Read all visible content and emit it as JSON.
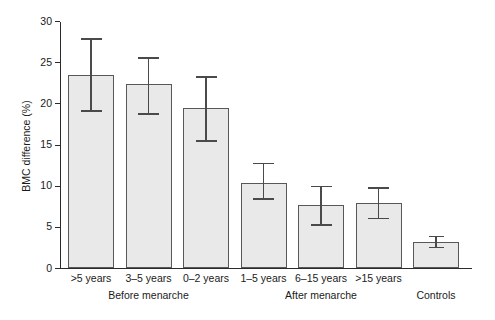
{
  "chart_data": {
    "type": "bar",
    "title": "",
    "xlabel": "",
    "ylabel": "BMC difference (%)",
    "ylim": [
      0,
      30
    ],
    "yticks": [
      0,
      5,
      10,
      15,
      20,
      25,
      30
    ],
    "ytick_labels": [
      "0",
      "5",
      "10",
      "15",
      "20",
      "25",
      "30"
    ],
    "grid": false,
    "legend": "none",
    "categories": [
      ">5 years",
      "3–5 years",
      "0–2 years",
      "1–5 years",
      "6–15 years",
      ">15 years",
      ""
    ],
    "values": [
      23.5,
      22.3,
      19.4,
      10.3,
      7.6,
      7.9,
      3.2
    ],
    "error_low": [
      19.2,
      18.8,
      15.5,
      8.5,
      5.3,
      6.1,
      2.6
    ],
    "error_high": [
      27.9,
      25.6,
      23.3,
      12.8,
      10.0,
      9.8,
      3.9
    ],
    "groups": [
      {
        "label": "Before menarche",
        "member_indices": [
          0,
          1,
          2
        ]
      },
      {
        "label": "After menarche",
        "member_indices": [
          3,
          4,
          5
        ]
      },
      {
        "label": "Controls",
        "member_indices": [
          6
        ]
      }
    ],
    "series": [
      {
        "name": "BMC difference (%)",
        "values": [
          23.5,
          22.3,
          19.4,
          10.3,
          7.6,
          7.9,
          3.2
        ]
      }
    ],
    "bar_fill_color": "#e9e9e9",
    "bar_edge_color": "#585858",
    "error_bar_color": "#4a4a4a",
    "axis_color": "#2b2b2b"
  },
  "captions": {
    "top": "",
    "bottom": ""
  }
}
